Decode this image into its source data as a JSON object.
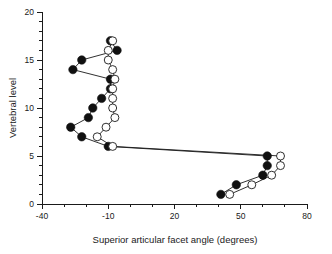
{
  "chart_data": {
    "type": "scatter",
    "title": "",
    "xlabel": "Superior articular facet angle (degrees)",
    "ylabel": "Vertebral level",
    "xlim": [
      -40,
      80
    ],
    "ylim": [
      0,
      20
    ],
    "xticks": [
      -40,
      -10,
      20,
      50,
      80
    ],
    "xtick_labels": [
      "-40",
      "-10",
      "20",
      "50",
      "80"
    ],
    "yticks": [
      0,
      5,
      10,
      15,
      20
    ],
    "ytick_labels": [
      "0",
      "5",
      "10",
      "15",
      "20"
    ],
    "x_minor_step": 10,
    "y_minor_step": 1,
    "grid": false,
    "legend": "none",
    "orientation": "x-is-angle, y-is-level",
    "series": [
      {
        "name": "filled-circles",
        "marker": "filled-circle",
        "color": "#101010",
        "points": [
          {
            "level": 1,
            "angle": 41
          },
          {
            "level": 2,
            "angle": 48
          },
          {
            "level": 3,
            "angle": 60
          },
          {
            "level": 4,
            "angle": 62
          },
          {
            "level": 5,
            "angle": 62
          },
          {
            "level": 6,
            "angle": -10
          },
          {
            "level": 7,
            "angle": -22
          },
          {
            "level": 8,
            "angle": -27
          },
          {
            "level": 9,
            "angle": -19
          },
          {
            "level": 10,
            "angle": -17
          },
          {
            "level": 11,
            "angle": -13
          },
          {
            "level": 12,
            "angle": -9
          },
          {
            "level": 13,
            "angle": -9
          },
          {
            "level": 14,
            "angle": -26
          },
          {
            "level": 15,
            "angle": -22
          },
          {
            "level": 16,
            "angle": -6
          },
          {
            "level": 17,
            "angle": -9
          }
        ]
      },
      {
        "name": "open-circles",
        "marker": "open-circle",
        "color": "#1a1a1a",
        "points": [
          {
            "level": 1,
            "angle": 45
          },
          {
            "level": 2,
            "angle": 55
          },
          {
            "level": 3,
            "angle": 64
          },
          {
            "level": 4,
            "angle": 68
          },
          {
            "level": 5,
            "angle": 68
          },
          {
            "level": 6,
            "angle": -8
          },
          {
            "level": 7,
            "angle": -15
          },
          {
            "level": 8,
            "angle": -11
          },
          {
            "level": 9,
            "angle": -7
          },
          {
            "level": 10,
            "angle": -8
          },
          {
            "level": 11,
            "angle": -8
          },
          {
            "level": 12,
            "angle": -8
          },
          {
            "level": 13,
            "angle": -7
          },
          {
            "level": 14,
            "angle": -8
          },
          {
            "level": 15,
            "angle": -10
          },
          {
            "level": 16,
            "angle": -10
          },
          {
            "level": 17,
            "angle": -8
          }
        ]
      }
    ]
  }
}
